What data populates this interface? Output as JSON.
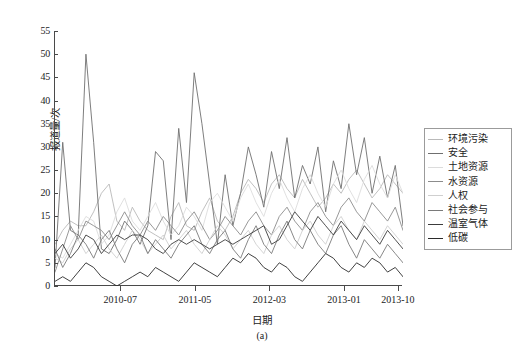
{
  "figure": {
    "caption": "(a)",
    "background_color": "#ffffff",
    "axis_color": "#4a4a4a"
  },
  "chart_data": {
    "type": "line",
    "title": "",
    "subtitle": "",
    "xlabel": "日期",
    "ylabel": "报道量/次",
    "ylim": [
      0,
      55
    ],
    "yticks": [
      0,
      5,
      10,
      15,
      20,
      25,
      30,
      35,
      40,
      45,
      50,
      55
    ],
    "ytick_labels": [
      "0",
      "5",
      "10",
      "15",
      "20",
      "25",
      "30",
      "35",
      "40",
      "45",
      "50",
      "55"
    ],
    "xtick_labels": [
      "2010-07",
      "2011-05",
      "2012-03",
      "2013-01",
      "2013-10"
    ],
    "xtick_positions": [
      0.1905,
      0.4048,
      0.619,
      0.8333,
      0.9881
    ],
    "grid": false,
    "legend_position": "right",
    "n_points": 46,
    "series": [
      {
        "name": "环境污染",
        "color": "#b9b9b9",
        "values": [
          9,
          12,
          14,
          13,
          13,
          16,
          20,
          22,
          14,
          12,
          17,
          14,
          12,
          11,
          10,
          15,
          18,
          13,
          12,
          16,
          19,
          14,
          12,
          15,
          20,
          23,
          21,
          18,
          22,
          24,
          21,
          19,
          23,
          20,
          17,
          19,
          22,
          20,
          23,
          25,
          22,
          19,
          21,
          24,
          22,
          20
        ]
      },
      {
        "name": "安全",
        "color": "#6f6f6f",
        "values": [
          4,
          31,
          12,
          11,
          50,
          31,
          8,
          7,
          10,
          14,
          12,
          9,
          13,
          29,
          27,
          10,
          34,
          18,
          46,
          35,
          22,
          9,
          24,
          13,
          20,
          30,
          24,
          17,
          29,
          21,
          32,
          19,
          26,
          22,
          30,
          16,
          27,
          21,
          35,
          24,
          32,
          20,
          28,
          19,
          26,
          13
        ]
      },
      {
        "name": "土地资源",
        "color": "#dcdcdc",
        "values": [
          7,
          6,
          9,
          12,
          15,
          14,
          9,
          11,
          16,
          19,
          14,
          12,
          15,
          18,
          14,
          11,
          13,
          17,
          15,
          12,
          18,
          20,
          17,
          14,
          19,
          22,
          18,
          15,
          20,
          23,
          19,
          16,
          21,
          24,
          20,
          17,
          22,
          25,
          21,
          18,
          23,
          26,
          22,
          19,
          24,
          20
        ]
      },
      {
        "name": "水资源",
        "color": "#8c8c8c",
        "values": [
          3,
          8,
          13,
          10,
          14,
          13,
          12,
          10,
          13,
          16,
          13,
          11,
          14,
          12,
          15,
          13,
          11,
          14,
          16,
          13,
          10,
          12,
          15,
          13,
          11,
          14,
          16,
          13,
          11,
          15,
          17,
          14,
          12,
          16,
          18,
          15,
          13,
          17,
          19,
          16,
          14,
          18,
          16,
          14,
          17,
          12
        ]
      },
      {
        "name": "人权",
        "color": "#cfcfcf",
        "values": [
          6,
          5,
          8,
          10,
          7,
          9,
          11,
          8,
          6,
          9,
          12,
          10,
          7,
          9,
          11,
          8,
          10,
          12,
          9,
          7,
          10,
          13,
          11,
          8,
          10,
          12,
          9,
          7,
          11,
          13,
          10,
          8,
          12,
          14,
          11,
          9,
          13,
          15,
          12,
          10,
          14,
          12,
          10,
          13,
          11,
          9
        ]
      },
      {
        "name": "社会参与",
        "color": "#7a7a7a",
        "values": [
          8,
          4,
          7,
          11,
          9,
          6,
          10,
          12,
          8,
          5,
          9,
          11,
          7,
          10,
          8,
          6,
          9,
          11,
          13,
          9,
          7,
          10,
          12,
          8,
          6,
          10,
          13,
          9,
          7,
          11,
          14,
          10,
          8,
          12,
          9,
          7,
          11,
          13,
          9,
          6,
          10,
          8,
          6,
          9,
          7,
          5
        ]
      },
      {
        "name": "温室气体",
        "color": "#3c3c3c",
        "values": [
          7,
          9,
          6,
          8,
          11,
          10,
          7,
          9,
          11,
          10,
          11,
          11,
          10,
          8,
          7,
          9,
          10,
          9,
          10,
          9,
          8,
          9,
          10,
          9,
          10,
          11,
          12,
          13,
          9,
          10,
          13,
          16,
          14,
          12,
          15,
          13,
          11,
          14,
          12,
          10,
          13,
          11,
          9,
          12,
          10,
          8
        ]
      },
      {
        "name": "低碳",
        "color": "#2b2b2b",
        "values": [
          1,
          2,
          1,
          3,
          5,
          4,
          2,
          1,
          0,
          1,
          2,
          3,
          2,
          4,
          3,
          2,
          1,
          3,
          5,
          4,
          3,
          2,
          4,
          6,
          5,
          7,
          6,
          4,
          3,
          5,
          4,
          2,
          1,
          3,
          5,
          7,
          6,
          4,
          3,
          5,
          4,
          6,
          5,
          3,
          4,
          2
        ]
      }
    ]
  }
}
